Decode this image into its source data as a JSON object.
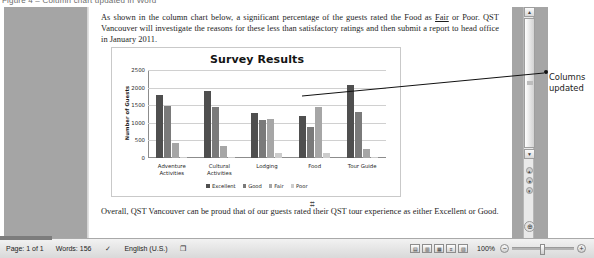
{
  "top_strip": {
    "text": "Figure 4 – Column chart updated in Word"
  },
  "document": {
    "paragraph_top_parts": [
      "As shown in the column chart below, a significant percentage of the guests rated the Food as ",
      "Fair",
      " or Poor. QST Vancouver will investigate the reasons for these less than satisfactory ratings and then submit a report to head office in January 2011."
    ],
    "paragraph_bottom": "Overall, QST Vancouver can be proud that of our guests rated their QST tour experience as either Excellent or Good.",
    "anchor_glyph": "⌗"
  },
  "chart_data": {
    "type": "bar",
    "title": "Survey Results",
    "xlabel": "",
    "ylabel": "Number of Guests",
    "ylim": [
      0,
      2500
    ],
    "yticks": [
      0,
      500,
      1000,
      1500,
      2000,
      2500
    ],
    "ytick_labels": [
      "0",
      "500",
      "1000",
      "1500",
      "2000",
      "2500"
    ],
    "grid": true,
    "legend_position": "bottom",
    "categories": [
      "Adventure\nActivities",
      "Cultural\nActivities",
      "Lodging",
      "Food",
      "Tour Guide"
    ],
    "series": [
      {
        "name": "Excellent",
        "color": "#4f4f4f",
        "values": [
          1780,
          1890,
          1280,
          1180,
          2070
        ]
      },
      {
        "name": "Good",
        "color": "#7a7a7a",
        "values": [
          1470,
          1450,
          1080,
          880,
          1310
        ]
      },
      {
        "name": "Fair",
        "color": "#a6a6a6",
        "values": [
          440,
          350,
          1120,
          1450,
          270
        ]
      },
      {
        "name": "Poor",
        "color": "#cccccc",
        "values": [
          20,
          15,
          140,
          150,
          30
        ]
      }
    ]
  },
  "callout": {
    "text": "Columns\nupdated"
  },
  "scrollbar": {
    "up_arrow": "▲",
    "down_arrow": "▼",
    "prev_page": "▴",
    "select_object": "●",
    "next_page": "▾",
    "end_button": "⊕"
  },
  "statusbar": {
    "page": "Page: 1 of 1",
    "words": "Words: 156",
    "proofing_icon": "✓",
    "language": "English (U.S.)",
    "macro_icon": "❐",
    "view_buttons": [
      {
        "name": "print-layout",
        "glyph": "▤"
      },
      {
        "name": "full-screen-reading",
        "glyph": "▥"
      },
      {
        "name": "web-layout",
        "glyph": "▦"
      },
      {
        "name": "outline",
        "glyph": "≡"
      },
      {
        "name": "draft",
        "glyph": "▧"
      }
    ],
    "zoom_level": "100%",
    "zoom_out": "−",
    "zoom_in": "+"
  }
}
